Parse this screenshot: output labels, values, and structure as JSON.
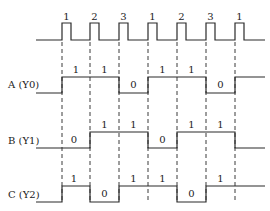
{
  "diagram": {
    "type": "timing-diagram",
    "clock": {
      "pulse_labels": [
        "1",
        "2",
        "3",
        "1",
        "2",
        "3",
        "1"
      ],
      "pulse_x": [
        62,
        90,
        119,
        148,
        177,
        206,
        235
      ],
      "pulse_width": 9,
      "base_y": 40,
      "top_y": 23,
      "start_x": 36,
      "end_x": 265
    },
    "signals": [
      {
        "name": "A (Y0)",
        "label_y": 88,
        "high_y": 77,
        "low_y": 93,
        "segments": [
          {
            "x0": 36,
            "x1": 62,
            "level": 0,
            "show": false
          },
          {
            "x0": 62,
            "x1": 90,
            "level": 1,
            "show": true,
            "text": "1"
          },
          {
            "x0": 90,
            "x1": 119,
            "level": 1,
            "show": true,
            "text": "1"
          },
          {
            "x0": 119,
            "x1": 148,
            "level": 0,
            "show": true,
            "text": "0"
          },
          {
            "x0": 148,
            "x1": 177,
            "level": 1,
            "show": true,
            "text": "1"
          },
          {
            "x0": 177,
            "x1": 206,
            "level": 1,
            "show": true,
            "text": "1"
          },
          {
            "x0": 206,
            "x1": 235,
            "level": 0,
            "show": true,
            "text": "0"
          },
          {
            "x0": 235,
            "x1": 265,
            "level": 1,
            "show": false
          }
        ]
      },
      {
        "name": "B (Y1)",
        "label_y": 144,
        "high_y": 132,
        "low_y": 148,
        "segments": [
          {
            "x0": 36,
            "x1": 90,
            "level": 0,
            "show": true,
            "text": "0",
            "text_x": 74
          },
          {
            "x0": 90,
            "x1": 119,
            "level": 1,
            "show": true,
            "text": "1"
          },
          {
            "x0": 119,
            "x1": 148,
            "level": 1,
            "show": true,
            "text": "1"
          },
          {
            "x0": 148,
            "x1": 177,
            "level": 0,
            "show": true,
            "text": "0"
          },
          {
            "x0": 177,
            "x1": 206,
            "level": 1,
            "show": true,
            "text": "1"
          },
          {
            "x0": 206,
            "x1": 235,
            "level": 1,
            "show": true,
            "text": "1"
          },
          {
            "x0": 235,
            "x1": 265,
            "level": 0,
            "show": false
          }
        ]
      },
      {
        "name": "C (Y2)",
        "label_y": 198,
        "high_y": 186,
        "low_y": 202,
        "segments": [
          {
            "x0": 36,
            "x1": 62,
            "level": 0,
            "show": false
          },
          {
            "x0": 62,
            "x1": 90,
            "level": 1,
            "show": true,
            "text": "1",
            "text_x": 74
          },
          {
            "x0": 90,
            "x1": 119,
            "level": 0,
            "show": true,
            "text": "0"
          },
          {
            "x0": 119,
            "x1": 148,
            "level": 1,
            "show": true,
            "text": "1"
          },
          {
            "x0": 148,
            "x1": 177,
            "level": 1,
            "show": true,
            "text": "1"
          },
          {
            "x0": 177,
            "x1": 206,
            "level": 0,
            "show": true,
            "text": "0"
          },
          {
            "x0": 206,
            "x1": 235,
            "level": 1,
            "show": true,
            "text": "1"
          },
          {
            "x0": 235,
            "x1": 265,
            "level": 1,
            "show": false
          }
        ]
      }
    ],
    "dash_lines": {
      "x": [
        62,
        90,
        119,
        148,
        177,
        206,
        235
      ],
      "y0": 42,
      "y1": 200
    },
    "colors": {
      "line": "#2a2a2a",
      "background": "#ffffff"
    }
  }
}
